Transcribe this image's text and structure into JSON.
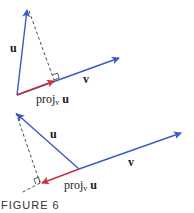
{
  "figure": {
    "caption": "FIGURE 6",
    "colors": {
      "vector": "#3a5bbf",
      "projection": "#c8323c",
      "dashed": "#333333"
    },
    "top": {
      "label_u": "u",
      "label_v": "v",
      "label_proj": "proj",
      "label_proj_sub": "v",
      "label_proj_vec": "u"
    },
    "bottom": {
      "label_u": "u",
      "label_v": "v",
      "label_proj": "proj",
      "label_proj_sub": "v",
      "label_proj_vec": "u"
    }
  }
}
